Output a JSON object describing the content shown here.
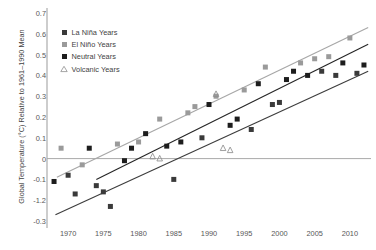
{
  "chart_data": {
    "type": "scatter",
    "title": "",
    "xlabel": "",
    "ylabel": "Global Temperature (°C) Relative to 1961–1990 Mean",
    "xlim": [
      1967,
      2013
    ],
    "ylim": [
      -0.3,
      0.7
    ],
    "grid": false,
    "zero_line": true,
    "legend_position": "top-left",
    "yticks": [
      "0.7",
      "0.6",
      "0.5",
      "0.4",
      "0.3",
      "0.2",
      "0.1",
      "0",
      "-0.1",
      "-1.2",
      "-0.3"
    ],
    "ytick_values": [
      0.7,
      0.6,
      0.5,
      0.4,
      0.3,
      0.2,
      0.1,
      0,
      -0.1,
      -0.2,
      -0.3
    ],
    "xticks": [
      "1970",
      "1975",
      "1980",
      "1985",
      "1990",
      "1995",
      "2000",
      "2005",
      "2010"
    ],
    "xtick_values": [
      1970,
      1975,
      1980,
      1985,
      1990,
      1995,
      2000,
      2005,
      2010
    ],
    "series": [
      {
        "name": "La Niña Years",
        "marker": "filled-square",
        "color": "#3a3a3a",
        "points": [
          {
            "x": 1970,
            "y": -0.08
          },
          {
            "x": 1971,
            "y": -0.17
          },
          {
            "x": 1974,
            "y": -0.13
          },
          {
            "x": 1975,
            "y": -0.16
          },
          {
            "x": 1976,
            "y": -0.23
          },
          {
            "x": 1985,
            "y": -0.1
          },
          {
            "x": 1989,
            "y": 0.1
          },
          {
            "x": 1996,
            "y": 0.14
          },
          {
            "x": 1999,
            "y": 0.26
          },
          {
            "x": 2000,
            "y": 0.27
          },
          {
            "x": 2006,
            "y": 0.42
          },
          {
            "x": 2008,
            "y": 0.4
          },
          {
            "x": 2011,
            "y": 0.41
          }
        ]
      },
      {
        "name": "El Niño Years",
        "marker": "gray-square",
        "color": "#9a9a9a",
        "points": [
          {
            "x": 1969,
            "y": 0.05
          },
          {
            "x": 1972,
            "y": -0.03
          },
          {
            "x": 1977,
            "y": 0.07
          },
          {
            "x": 1980,
            "y": 0.08
          },
          {
            "x": 1983,
            "y": 0.19
          },
          {
            "x": 1987,
            "y": 0.22
          },
          {
            "x": 1988,
            "y": 0.25
          },
          {
            "x": 1991,
            "y": 0.3
          },
          {
            "x": 1995,
            "y": 0.33
          },
          {
            "x": 1998,
            "y": 0.44
          },
          {
            "x": 2003,
            "y": 0.46
          },
          {
            "x": 2005,
            "y": 0.48
          },
          {
            "x": 2007,
            "y": 0.49
          },
          {
            "x": 2010,
            "y": 0.58
          }
        ]
      },
      {
        "name": "Neutral Years",
        "marker": "black-square",
        "color": "#1d1d1d",
        "points": [
          {
            "x": 1968,
            "y": -0.11
          },
          {
            "x": 1973,
            "y": 0.05
          },
          {
            "x": 1978,
            "y": -0.01
          },
          {
            "x": 1979,
            "y": 0.05
          },
          {
            "x": 1981,
            "y": 0.12
          },
          {
            "x": 1984,
            "y": 0.06
          },
          {
            "x": 1986,
            "y": 0.08
          },
          {
            "x": 1990,
            "y": 0.26
          },
          {
            "x": 1993,
            "y": 0.16
          },
          {
            "x": 1994,
            "y": 0.19
          },
          {
            "x": 1997,
            "y": 0.36
          },
          {
            "x": 2001,
            "y": 0.38
          },
          {
            "x": 2002,
            "y": 0.42
          },
          {
            "x": 2004,
            "y": 0.4
          },
          {
            "x": 2009,
            "y": 0.46
          },
          {
            "x": 2012,
            "y": 0.45
          }
        ]
      },
      {
        "name": "Volcanic Years",
        "marker": "open-triangle",
        "color": "#8e8e8e",
        "points": [
          {
            "x": 1982,
            "y": 0.01
          },
          {
            "x": 1983,
            "y": 0.0
          },
          {
            "x": 1991,
            "y": 0.31
          },
          {
            "x": 1992,
            "y": 0.05
          },
          {
            "x": 1993,
            "y": 0.04
          }
        ]
      }
    ],
    "trendlines": [
      {
        "name": "el-nino-trend",
        "color": "#a7a7a7",
        "x1": 1968.4,
        "y1": -0.09,
        "x2": 2012.6,
        "y2": 0.63
      },
      {
        "name": "neutral-trend",
        "color": "#262626",
        "x1": 1974.0,
        "y1": -0.1,
        "x2": 2012.6,
        "y2": 0.55
      },
      {
        "name": "la-nina-trend",
        "color": "#3d3d3d",
        "x1": 1968.2,
        "y1": -0.27,
        "x2": 2012.6,
        "y2": 0.42
      }
    ]
  },
  "legend": {
    "items": [
      {
        "label": "La Niña Years"
      },
      {
        "label": "El Niño Years"
      },
      {
        "label": "Neutral Years"
      },
      {
        "label": "Volcanic Years"
      }
    ]
  }
}
